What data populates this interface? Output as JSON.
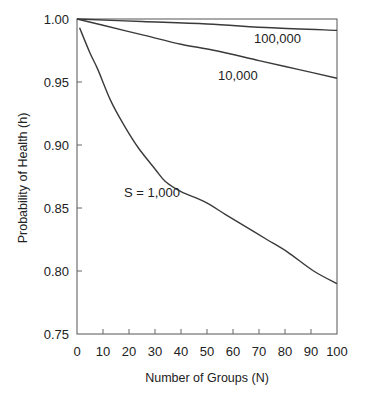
{
  "chart_data": {
    "type": "line",
    "title": "",
    "xlabel": "Number of Groups (N)",
    "ylabel": "Probability of Health (h)",
    "xlim": [
      0,
      100
    ],
    "ylim": [
      0.75,
      1.0
    ],
    "grid": false,
    "legend": "inline curve labels",
    "x_ticks": [
      0,
      10,
      20,
      30,
      40,
      50,
      60,
      70,
      80,
      90,
      100
    ],
    "x_tick_labels": [
      "0",
      "10",
      "20",
      "30",
      "40",
      "50",
      "60",
      "70",
      "80",
      "90",
      "100"
    ],
    "y_ticks": [
      0.75,
      0.8,
      0.85,
      0.9,
      0.95,
      1.0
    ],
    "y_tick_labels": [
      "0.75",
      "0.80",
      "0.85",
      "0.90",
      "0.95",
      "1.00"
    ],
    "series": [
      {
        "name": "S = 1,000",
        "label": "S = 1,000",
        "label_pos": {
          "x": 124,
          "y": 197
        },
        "x": [
          1,
          5,
          8,
          13,
          18,
          23.5,
          30,
          34,
          40,
          49,
          57,
          65,
          73,
          81,
          91,
          100
        ],
        "values": [
          0.993,
          0.973,
          0.96,
          0.935,
          0.916,
          0.898,
          0.881,
          0.871,
          0.863,
          0.855,
          0.845,
          0.835,
          0.825,
          0.815,
          0.8,
          0.79
        ]
      },
      {
        "name": "10,000",
        "label": "10,000",
        "label_pos": {
          "x": 218,
          "y": 80
        },
        "x": [
          0,
          10,
          26,
          40,
          53,
          70,
          85,
          100
        ],
        "values": [
          1.0,
          0.995,
          0.987,
          0.98,
          0.975,
          0.967,
          0.96,
          0.953
        ]
      },
      {
        "name": "100,000",
        "label": "100,000",
        "label_pos": {
          "x": 254,
          "y": 43
        },
        "x": [
          0,
          25,
          50,
          75,
          100
        ],
        "values": [
          1.0,
          0.998,
          0.996,
          0.993,
          0.991
        ]
      }
    ]
  }
}
